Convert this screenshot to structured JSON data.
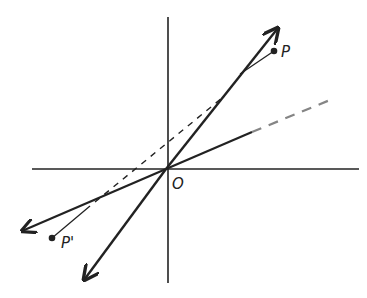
{
  "diagram": {
    "type": "reflection-through-origin",
    "labels": {
      "origin": "O",
      "point": "P",
      "image_point": "P'"
    },
    "colors": {
      "ink": "#222222",
      "background": "#ffffff"
    },
    "elements": [
      "x-axis",
      "y-axis",
      "line-through-origin-steep (double arrow)",
      "line-through-origin-shallow (double arrow)",
      "dashed line from P' toward P",
      "point P",
      "point P' (reflection of P through O)"
    ]
  }
}
